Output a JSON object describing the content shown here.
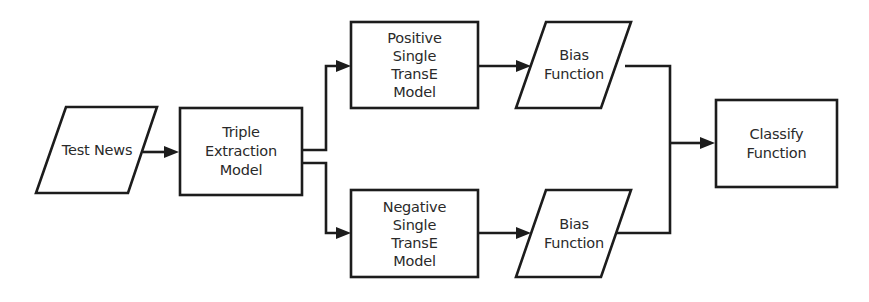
{
  "diagram": {
    "type": "flowchart",
    "direction": "left-to-right",
    "colors": {
      "stroke": "#1c1c1c",
      "text": "#2a2a2a",
      "background": "#ffffff"
    },
    "nodes": {
      "test_news": {
        "shape": "parallelogram",
        "lines": [
          "Test News"
        ]
      },
      "triple_extraction": {
        "shape": "rectangle",
        "lines": [
          "Triple",
          "Extraction",
          "Model"
        ]
      },
      "positive_transe": {
        "shape": "rectangle",
        "lines": [
          "Positive",
          "Single",
          "TransE",
          "Model"
        ]
      },
      "negative_transe": {
        "shape": "rectangle",
        "lines": [
          "Negative",
          "Single",
          "TransE",
          "Model"
        ]
      },
      "bias_top": {
        "shape": "parallelogram",
        "lines": [
          "Bias",
          "Function"
        ]
      },
      "bias_bottom": {
        "shape": "parallelogram",
        "lines": [
          "Bias",
          "Function"
        ]
      },
      "classify": {
        "shape": "rectangle",
        "lines": [
          "Classify",
          "Function"
        ]
      }
    },
    "edges": [
      {
        "from": "Test News",
        "to": "Triple Extraction Model"
      },
      {
        "from": "Triple Extraction Model",
        "to": "Positive Single TransE Model"
      },
      {
        "from": "Triple Extraction Model",
        "to": "Negative Single TransE Model"
      },
      {
        "from": "Positive Single TransE Model",
        "to": "Bias Function (top)"
      },
      {
        "from": "Negative Single TransE Model",
        "to": "Bias Function (bottom)"
      },
      {
        "from": "Bias Function (top) + Bias Function (bottom)",
        "to": "Classify Function"
      }
    ]
  }
}
